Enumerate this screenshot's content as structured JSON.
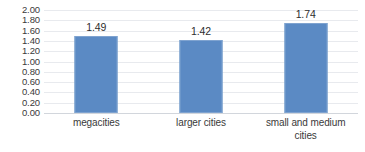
{
  "chart_data": {
    "type": "bar",
    "title": "",
    "subtitle": "",
    "xlabel": "",
    "ylabel": "",
    "categories": [
      "megacities",
      "larger cities",
      "small and medium cities"
    ],
    "category_lines": [
      [
        "megacities"
      ],
      [
        "larger cities"
      ],
      [
        "small and medium",
        "cities"
      ]
    ],
    "values": [
      1.49,
      1.42,
      1.74
    ],
    "value_labels": [
      "1.49",
      "1.42",
      "1.74"
    ],
    "ylim": [
      0.0,
      2.0
    ],
    "ytick_step": 0.2,
    "ytick_labels": [
      "2.00",
      "1.80",
      "1.60",
      "1.40",
      "1.20",
      "1.00",
      "0.80",
      "0.60",
      "0.40",
      "0.20",
      "0.00"
    ],
    "ytick_values": [
      2.0,
      1.8,
      1.6,
      1.4,
      1.2,
      1.0,
      0.8,
      0.6,
      0.4,
      0.2,
      0.0
    ],
    "grid": true,
    "grid_orientation": "horizontal",
    "legend": false,
    "legend_position": "none",
    "bar_color": "#5b8ac4",
    "bar_border_color": "#7fa3d0",
    "gridline_color": "#e8eaee",
    "axis_text_color": "#3a3a3a",
    "value_label_color": "#2e2e2e",
    "background_color": "#ffffff"
  }
}
